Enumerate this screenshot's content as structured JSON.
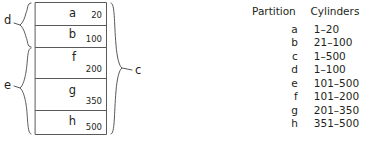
{
  "diagram": {
    "name": "disk-partition-diagram",
    "rows": [
      {
        "letter": "a",
        "size": "20"
      },
      {
        "letter": "b",
        "size": "100"
      },
      {
        "letter": "f",
        "size": "200"
      },
      {
        "letter": "g",
        "size": "350"
      },
      {
        "letter": "h",
        "size": "500"
      }
    ],
    "braces": [
      {
        "name": "d",
        "label": "d",
        "side": "left"
      },
      {
        "name": "e",
        "label": "e",
        "side": "left"
      },
      {
        "name": "c",
        "label": "c",
        "side": "right"
      }
    ],
    "stroke_color": "#58595b"
  },
  "table": {
    "name": "partition-cylinders-table",
    "headers": [
      "Partition",
      "Cylinders"
    ],
    "rows": [
      {
        "partition": "a",
        "cylinders": "1–20"
      },
      {
        "partition": "b",
        "cylinders": "21–100"
      },
      {
        "partition": "c",
        "cylinders": "1–500"
      },
      {
        "partition": "d",
        "cylinders": "1–100"
      },
      {
        "partition": "e",
        "cylinders": "101–500"
      },
      {
        "partition": "f",
        "cylinders": "101–200"
      },
      {
        "partition": "g",
        "cylinders": "201–350"
      },
      {
        "partition": "h",
        "cylinders": "351–500"
      }
    ]
  }
}
